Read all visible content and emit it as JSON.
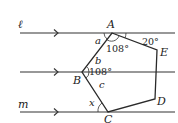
{
  "diagram": {
    "lines": [
      {
        "id": "l",
        "label": "ℓ",
        "y": 33
      },
      {
        "id": "mid",
        "label": "",
        "y": 72
      },
      {
        "id": "m",
        "label": "m",
        "y": 112
      }
    ],
    "points": {
      "A": {
        "label": "A",
        "x": 112,
        "y": 33
      },
      "B": {
        "label": "B",
        "x": 82,
        "y": 72
      },
      "C": {
        "label": "C",
        "x": 108,
        "y": 112
      },
      "D": {
        "label": "D",
        "x": 155,
        "y": 99
      },
      "E": {
        "label": "E",
        "x": 157,
        "y": 50
      }
    },
    "angles": {
      "A_interior": "108°",
      "B_interior": "108°",
      "A_E_line": "20°"
    },
    "variables": {
      "a": "a",
      "b": "b",
      "c": "c",
      "x": "x"
    }
  }
}
